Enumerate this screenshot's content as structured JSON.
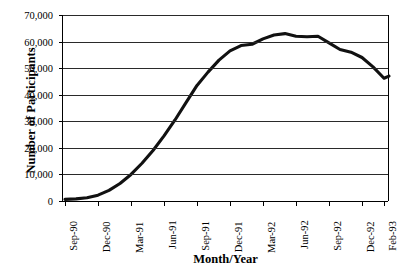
{
  "chart_data": {
    "type": "line",
    "title": "",
    "xlabel": "Month/Year",
    "ylabel": "Number of Participants",
    "ylim": [
      0,
      70000
    ],
    "ytick_step": 10000,
    "grid": true,
    "legend": false,
    "legend_position": "none",
    "line_color": "#111111",
    "ytick_labels": [
      "70,000",
      "60,000",
      "50,000",
      "40,000",
      "30,000",
      "20,000",
      "10,000",
      "0"
    ],
    "ytick_values": [
      70000,
      60000,
      50000,
      40000,
      30000,
      20000,
      10000,
      0
    ],
    "xtick_labels": [
      "Sep-90",
      "Dec-90",
      "Mar-91",
      "Jun-91",
      "Sep-91",
      "Dec-91",
      "Mar-92",
      "Jun-92",
      "Sep-92",
      "Dec-92",
      "Feb-93"
    ],
    "xtick_index": [
      0,
      3,
      6,
      9,
      12,
      15,
      18,
      21,
      24,
      27,
      29
    ],
    "categories": [
      "Sep-90",
      "Oct-90",
      "Nov-90",
      "Dec-90",
      "Jan-91",
      "Feb-91",
      "Mar-91",
      "Apr-91",
      "May-91",
      "Jun-91",
      "Jul-91",
      "Aug-91",
      "Sep-91",
      "Oct-91",
      "Nov-91",
      "Dec-91",
      "Jan-92",
      "Feb-92",
      "Mar-92",
      "Apr-92",
      "May-92",
      "Jun-92",
      "Jul-92",
      "Aug-92",
      "Sep-92",
      "Oct-92",
      "Nov-92",
      "Dec-92",
      "Jan-93",
      "Feb-93"
    ],
    "values": [
      600,
      800,
      1200,
      2200,
      4000,
      6600,
      10000,
      14200,
      19000,
      24500,
      30500,
      37000,
      43500,
      48500,
      53000,
      56500,
      58500,
      59000,
      61000,
      62500,
      63000,
      62000,
      61800,
      62000,
      59500,
      57000,
      56000,
      54000,
      50500,
      46200
    ],
    "final_value": 47000
  },
  "axis": {
    "y_title": "Number of Participants",
    "x_title": "Month/Year"
  }
}
